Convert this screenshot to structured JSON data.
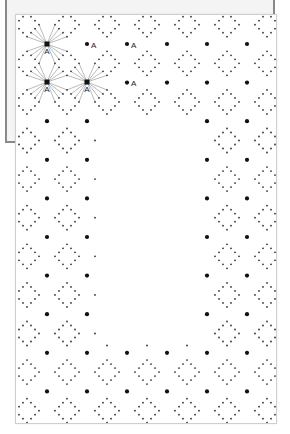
{
  "pattern": {
    "hub_label": "A",
    "dot_label": "A",
    "grid": {
      "big_dot_cols": [
        47,
        87,
        127,
        167,
        207,
        247
      ],
      "row_origin": 44,
      "row_step": 38.6,
      "row_count": 10,
      "diamond_cols": [
        27,
        67,
        107,
        147,
        187,
        227,
        267
      ],
      "diamond_row_origin": 24.7,
      "diamond_radius": 12
    },
    "empty_region": {
      "x0": 95,
      "x1": 200,
      "y0": 120,
      "y1": 345
    },
    "hubs": [
      {
        "x": 47,
        "y": 44
      },
      {
        "x": 47,
        "y": 82
      },
      {
        "x": 87,
        "y": 82
      }
    ],
    "labeled_dots": [
      {
        "x": 87,
        "y": 44
      },
      {
        "x": 127,
        "y": 44
      },
      {
        "x": 127,
        "y": 82
      }
    ],
    "colors": {
      "big_dot": "#111111",
      "small_dot": "#333333",
      "hub_line": "#777777",
      "label": "#222222"
    }
  }
}
